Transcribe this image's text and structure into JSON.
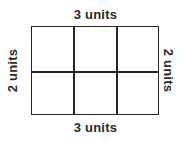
{
  "diagram": {
    "type": "rectangle-grid",
    "background_color": "#ffffff",
    "line_color": "#262626",
    "text_color": "#2b2b2b",
    "rectangle": {
      "columns": 3,
      "rows": 2,
      "total_cells": 6
    },
    "labels": {
      "top": "3 units",
      "bottom": "3 units",
      "left": "2 units",
      "right": "2 units"
    }
  }
}
